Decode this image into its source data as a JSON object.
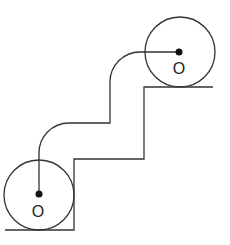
{
  "diagram": {
    "colors": {
      "line": "#333333",
      "background": "#ffffff",
      "dot": "#111111"
    },
    "wheels": [
      {
        "id": "bottom",
        "cx": 39,
        "cy": 195,
        "r": 35,
        "label": "O",
        "label_x": 38,
        "label_y": 217
      },
      {
        "id": "top",
        "cx": 180,
        "cy": 52,
        "r": 35,
        "label": "O",
        "label_x": 179,
        "label_y": 74
      }
    ],
    "dots": [
      {
        "id": "bottom-center-dot",
        "cx": 39,
        "cy": 194,
        "r": 3.5
      },
      {
        "id": "top-center-dot",
        "cx": 179,
        "cy": 52,
        "r": 3.5
      }
    ],
    "ground_path": "M5 230 L74 230 L74 159 L144 159 L144 87 L213 87",
    "cable_path": "M39 194 L39 153 A30 30 0 0 1 69 123 L110 123 L110 82 A30 30 0 0 1 140 52 L179 52"
  }
}
